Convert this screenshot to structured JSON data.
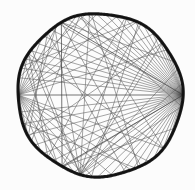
{
  "figure": {
    "kind": "geometric-diagram",
    "background_color": "#fcfcfc",
    "rim_color": "#111111",
    "chord_color": "#5a5a5a",
    "chord_color_heavy": "#3a3a3a"
  },
  "chart_data": {
    "type": "scatter",
    "subtitle": "",
    "xlabel": "",
    "ylabel": "",
    "xlim": [
      0,
      195
    ],
    "ylim": [
      0,
      190
    ],
    "grid": false,
    "legend": null,
    "tick_labels": [],
    "annotations": [],
    "circle": {
      "cx": 100,
      "cy": 95,
      "r": 82,
      "rim_width": 3.2,
      "rim_irregular": true,
      "rim_wobble_amplitude": 1.6,
      "rim_wobble_lobes": 7
    },
    "vertices": {
      "description": "Angles in degrees measured counter-clockwise from positive x-axis (screen y is inverted).",
      "hub_right_deg": 0,
      "hub_left_deg": 180
    },
    "fan_right": {
      "origin_deg": 0,
      "target_start_deg": 24,
      "target_end_deg": 168,
      "count": 22,
      "weight": "thin"
    },
    "fan_right_lower": {
      "origin_deg": 0,
      "target_start_deg": -24,
      "target_end_deg": -168,
      "count": 18,
      "weight": "thin"
    },
    "fan_left": {
      "origin_deg": 180,
      "target_start_deg": 150,
      "target_end_deg": 34,
      "count": 9,
      "weight": "thin"
    },
    "fan_left_lower": {
      "origin_deg": 180,
      "target_start_deg": -150,
      "target_end_deg": -40,
      "count": 9,
      "weight": "thin"
    },
    "fan_bottom": {
      "origin_deg": -104,
      "target_start_deg": -8,
      "target_end_deg": 150,
      "count": 7,
      "weight": "thin"
    },
    "explicit_chords": [
      {
        "a_deg": 180,
        "b_deg": 0,
        "weight": "heavy",
        "label": "horizontal-diameter"
      },
      {
        "a_deg": 118,
        "b_deg": -118,
        "weight": "heavy",
        "label": "vertical-chord"
      },
      {
        "a_deg": 118,
        "b_deg": 0,
        "weight": "heavy",
        "label": "upper-left-to-right-hub"
      },
      {
        "a_deg": -118,
        "b_deg": 0,
        "weight": "heavy",
        "label": "lower-left-to-right-hub"
      },
      {
        "a_deg": 118,
        "b_deg": -60,
        "weight": "thin",
        "label": "diagonal-a"
      },
      {
        "a_deg": -118,
        "b_deg": 60,
        "weight": "thin",
        "label": "diagonal-b"
      },
      {
        "a_deg": 150,
        "b_deg": -40,
        "weight": "thin",
        "label": "diagonal-c"
      },
      {
        "a_deg": -150,
        "b_deg": 40,
        "weight": "thin",
        "label": "diagonal-d"
      },
      {
        "a_deg": 96,
        "b_deg": -62,
        "weight": "thin",
        "label": "diagonal-e"
      },
      {
        "a_deg": -96,
        "b_deg": 62,
        "weight": "thin",
        "label": "diagonal-f"
      },
      {
        "a_deg": 160,
        "b_deg": 64,
        "weight": "thin",
        "label": "upper-arc-chord"
      },
      {
        "a_deg": -160,
        "b_deg": -64,
        "weight": "thin",
        "label": "lower-arc-chord"
      },
      {
        "a_deg": 168,
        "b_deg": 100,
        "weight": "thin",
        "label": "upper-left-short"
      },
      {
        "a_deg": -168,
        "b_deg": -100,
        "weight": "thin",
        "label": "lower-left-short"
      },
      {
        "a_deg": 130,
        "b_deg": -150,
        "weight": "thin",
        "label": "left-span"
      },
      {
        "a_deg": -130,
        "b_deg": 150,
        "weight": "thin",
        "label": "left-span-mirror"
      },
      {
        "a_deg": 72,
        "b_deg": -130,
        "weight": "thin",
        "label": "long-diagonal-a"
      },
      {
        "a_deg": -72,
        "b_deg": 130,
        "weight": "thin",
        "label": "long-diagonal-b"
      },
      {
        "a_deg": 40,
        "b_deg": -104,
        "weight": "thin",
        "label": "long-diagonal-c"
      },
      {
        "a_deg": -40,
        "b_deg": 104,
        "weight": "thin",
        "label": "long-diagonal-d"
      },
      {
        "a_deg": 146,
        "b_deg": -104,
        "weight": "thin",
        "label": "long-diagonal-e"
      },
      {
        "a_deg": -146,
        "b_deg": 104,
        "weight": "thin",
        "label": "long-diagonal-f"
      },
      {
        "a_deg": 118,
        "b_deg": 24,
        "weight": "thin",
        "label": "top-chord-a"
      },
      {
        "a_deg": -118,
        "b_deg": -24,
        "weight": "thin",
        "label": "bottom-chord-a"
      },
      {
        "a_deg": 104,
        "b_deg": -8,
        "weight": "thin",
        "label": "mid-chord-a"
      },
      {
        "a_deg": -104,
        "b_deg": 8,
        "weight": "thin",
        "label": "mid-chord-b"
      },
      {
        "a_deg": 156,
        "b_deg": -122,
        "weight": "thin",
        "label": "left-lobe-a"
      },
      {
        "a_deg": -156,
        "b_deg": 122,
        "weight": "thin",
        "label": "left-lobe-b"
      }
    ]
  }
}
